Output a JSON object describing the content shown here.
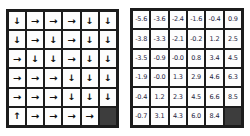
{
  "figure": {
    "background_color": "#ffffff",
    "grid_line_color": "#1c1c1c",
    "goal_cell_color": "#3d3d3d",
    "value_text_color": "#1d2440",
    "arrow_color": "#111111"
  },
  "arrow_glyphs": {
    "up": "↑",
    "down": "↓",
    "left": "←",
    "right": "→"
  },
  "policy_grid": {
    "rows": 6,
    "cols": 6,
    "goal": {
      "row": 5,
      "col": 5
    },
    "cells": [
      [
        "down",
        "right",
        "right",
        "right",
        "down",
        "down"
      ],
      [
        "down",
        "right",
        "down",
        "right",
        "down",
        "down"
      ],
      [
        "right",
        "down",
        "down",
        "right",
        "down",
        "down"
      ],
      [
        "right",
        "right",
        "right",
        "down",
        "down",
        "down"
      ],
      [
        "right",
        "right",
        "right",
        "down",
        "down",
        "down"
      ],
      [
        "up",
        "right",
        "right",
        "right",
        "right",
        "goal"
      ]
    ]
  },
  "value_grid": {
    "rows": 6,
    "cols": 6,
    "goal": {
      "row": 5,
      "col": 5
    },
    "values": [
      [
        "-5.6",
        "-3.6",
        "-2.4",
        "-1.6",
        "-0.4",
        "0.9"
      ],
      [
        "-3.8",
        "-3.3",
        "-2.1",
        "-0.2",
        "1.2",
        "2.5"
      ],
      [
        "-3.5",
        "-0.9",
        "-0.0",
        "0.8",
        "3.4",
        "4.5"
      ],
      [
        "-1.9",
        "-0.0",
        "1.3",
        "2.9",
        "4.6",
        "6.3"
      ],
      [
        "-0.4",
        "1.2",
        "2.3",
        "4.5",
        "6.6",
        "8.5"
      ],
      [
        "-0.7",
        "3.1",
        "4.3",
        "6.0",
        "8.4",
        "goal"
      ]
    ]
  }
}
